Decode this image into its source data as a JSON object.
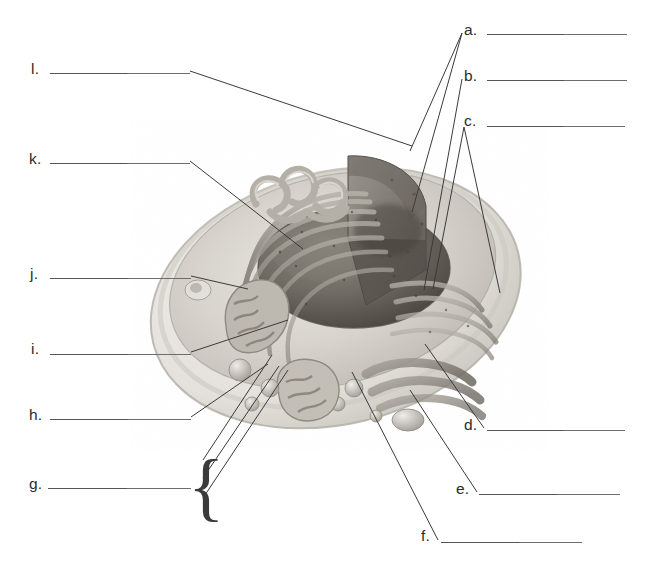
{
  "worksheet": {
    "title": "Animal Cell Labeling Diagram",
    "subject": "Cell Biology",
    "instruction_visible": false,
    "ink_color": "#3a3a3a",
    "rule_color": "#6d6d6d",
    "background_color": "#ffffff"
  },
  "figure": {
    "name": "animal-cell-cutaway",
    "style": "grayscale 3D cutaway illustration"
  },
  "labels": [
    {
      "id": "a",
      "letter": "a.",
      "answer": "",
      "side": "right",
      "letter_x": 464,
      "letter_y": 22,
      "rule_x": 487,
      "rule_y": 34,
      "rule_w": 140
    },
    {
      "id": "b",
      "letter": "b.",
      "answer": "",
      "side": "right",
      "letter_x": 464,
      "letter_y": 68,
      "rule_x": 487,
      "rule_y": 80,
      "rule_w": 140
    },
    {
      "id": "c",
      "letter": "c.",
      "answer": "",
      "side": "right",
      "letter_x": 464,
      "letter_y": 113,
      "rule_x": 487,
      "rule_y": 126,
      "rule_w": 138
    },
    {
      "id": "d",
      "letter": "d.",
      "answer": "",
      "side": "right",
      "letter_x": 464,
      "letter_y": 417,
      "rule_x": 487,
      "rule_y": 430,
      "rule_w": 138
    },
    {
      "id": "e",
      "letter": "e.",
      "answer": "",
      "side": "right",
      "letter_x": 456,
      "letter_y": 481,
      "rule_x": 479,
      "rule_y": 494,
      "rule_w": 141
    },
    {
      "id": "f",
      "letter": "f.",
      "answer": "",
      "side": "right",
      "letter_x": 421,
      "letter_y": 528,
      "rule_x": 441,
      "rule_y": 542,
      "rule_w": 141
    },
    {
      "id": "g",
      "letter": "g.",
      "answer": "",
      "side": "left",
      "letter_x": 29,
      "letter_y": 476,
      "rule_x": 48,
      "rule_y": 488,
      "rule_w": 143
    },
    {
      "id": "h",
      "letter": "h.",
      "answer": "",
      "side": "left",
      "letter_x": 29,
      "letter_y": 407,
      "rule_x": 50,
      "rule_y": 419,
      "rule_w": 141
    },
    {
      "id": "i",
      "letter": "i.",
      "answer": "",
      "side": "left",
      "letter_x": 31,
      "letter_y": 341,
      "rule_x": 50,
      "rule_y": 354,
      "rule_w": 141
    },
    {
      "id": "j",
      "letter": "j.",
      "answer": "",
      "side": "left",
      "letter_x": 30,
      "letter_y": 266,
      "rule_x": 50,
      "rule_y": 278,
      "rule_w": 141
    },
    {
      "id": "k",
      "letter": "k.",
      "answer": "",
      "side": "left",
      "letter_x": 29,
      "letter_y": 151,
      "rule_x": 50,
      "rule_y": 163,
      "rule_w": 140
    },
    {
      "id": "l",
      "letter": "l.",
      "answer": "",
      "side": "left",
      "letter_x": 31,
      "letter_y": 61,
      "rule_x": 50,
      "rule_y": 73,
      "rule_w": 140
    }
  ],
  "brace": {
    "name": "g-group-brace",
    "glyph": "{",
    "x": 188,
    "y": 448,
    "height": 72,
    "font_size": 76,
    "groups": 3
  },
  "leaders": [
    {
      "for": "l",
      "points": "190,71 412,146"
    },
    {
      "for": "k",
      "points": "190,161 303,249"
    },
    {
      "for": "j",
      "points": "191,276 248,289"
    },
    {
      "for": "i",
      "points": "191,352 288,320"
    },
    {
      "for": "h",
      "points": "191,417 268,364"
    },
    {
      "for": "g1",
      "points": "203,460 272,355"
    },
    {
      "for": "g2",
      "points": "203,478 279,366"
    },
    {
      "for": "g3",
      "points": "203,498 288,370"
    },
    {
      "for": "a",
      "points": "462,33 410,151"
    },
    {
      "for": "a2",
      "points": "462,33 412,212"
    },
    {
      "for": "b",
      "points": "462,79 424,290"
    },
    {
      "for": "c1",
      "points": "464,127 433,289"
    },
    {
      "for": "c2",
      "points": "464,127 500,293"
    },
    {
      "for": "d",
      "points": "484,428 425,344"
    },
    {
      "for": "e",
      "points": "477,492 410,390"
    },
    {
      "for": "f",
      "points": "438,540 352,372"
    }
  ]
}
